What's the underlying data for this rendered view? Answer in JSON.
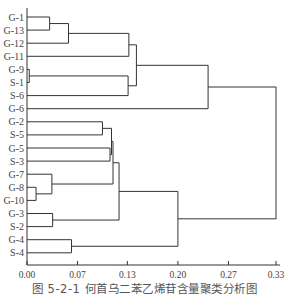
{
  "chart_data": {
    "type": "dendrogram",
    "title": "",
    "caption": "图 5-2-1   何首乌二苯乙烯苷含量聚类分析图",
    "xlabel": "",
    "ylabel": "",
    "xlim": [
      0,
      0.33
    ],
    "x_ticks": [
      "0.00",
      "0.07",
      "0.13",
      "0.20",
      "0.27",
      "0.33"
    ],
    "x_tick_values": [
      0.0,
      0.067,
      0.133,
      0.2,
      0.267,
      0.33
    ],
    "grid": false,
    "leaves": [
      "G-1",
      "G-13",
      "G-12",
      "G-11",
      "G-9",
      "S-1",
      "S-6",
      "G-6",
      "G-2",
      "S-5",
      "G-5",
      "S-3",
      "G-7",
      "G-8",
      "G-10",
      "G-3",
      "S-2",
      "G-4",
      "S-4"
    ],
    "merges": [
      {
        "id": "c1",
        "members": [
          "G-1",
          "G-13"
        ],
        "height": 0.03
      },
      {
        "id": "c2",
        "members": [
          "c1",
          "G-12"
        ],
        "height": 0.055
      },
      {
        "id": "c3",
        "members": [
          "c2",
          "G-11"
        ],
        "height": 0.135
      },
      {
        "id": "c4",
        "members": [
          "G-9",
          "S-1"
        ],
        "height": 0.003
      },
      {
        "id": "c5",
        "members": [
          "c4",
          "S-6"
        ],
        "height": 0.134
      },
      {
        "id": "c6",
        "members": [
          "c3",
          "c5"
        ],
        "height": 0.145
      },
      {
        "id": "c7",
        "members": [
          "c6",
          "G-6"
        ],
        "height": 0.24
      },
      {
        "id": "c8",
        "members": [
          "G-2",
          "S-5"
        ],
        "height": 0.1
      },
      {
        "id": "c9",
        "members": [
          "G-5",
          "S-3"
        ],
        "height": 0.11
      },
      {
        "id": "c10",
        "members": [
          "c8",
          "c9"
        ],
        "height": 0.112
      },
      {
        "id": "c11",
        "members": [
          "G-8",
          "G-10"
        ],
        "height": 0.012
      },
      {
        "id": "c12",
        "members": [
          "G-7",
          "c11"
        ],
        "height": 0.033
      },
      {
        "id": "c13",
        "members": [
          "c10",
          "c12"
        ],
        "height": 0.114
      },
      {
        "id": "c14",
        "members": [
          "G-3",
          "S-2"
        ],
        "height": 0.034
      },
      {
        "id": "c15",
        "members": [
          "c13",
          "c14"
        ],
        "height": 0.122
      },
      {
        "id": "c16",
        "members": [
          "G-4",
          "S-4"
        ],
        "height": 0.059
      },
      {
        "id": "c17",
        "members": [
          "c15",
          "c16"
        ],
        "height": 0.2
      },
      {
        "id": "c18",
        "members": [
          "c7",
          "c17"
        ],
        "height": 0.33
      }
    ]
  },
  "figure": {
    "caption": "图 5-2-1   何首乌二苯乙烯苷含量聚类分析图"
  },
  "style": {
    "line_color": "#333333",
    "text_color": "#444444"
  }
}
